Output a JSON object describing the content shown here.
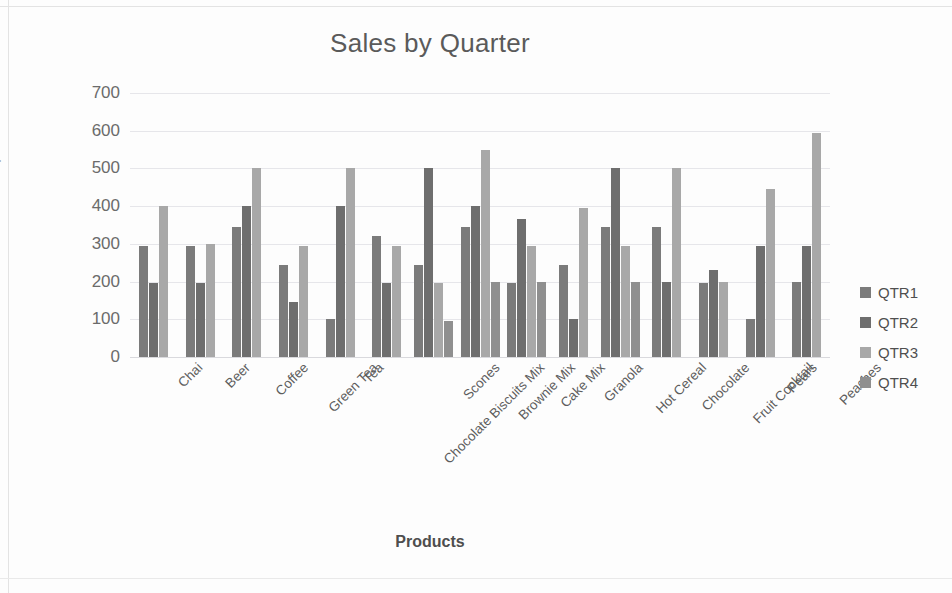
{
  "chart_data": {
    "type": "bar",
    "title": "Sales by Quarter",
    "xlabel": "Products",
    "ylabel": "Sales $",
    "ylim": [
      0,
      700
    ],
    "yticks": [
      700,
      600,
      500,
      400,
      300,
      200,
      100,
      0
    ],
    "grid": true,
    "legend_position": "right",
    "categories": [
      "Chai",
      "Beer",
      "Coffee",
      "Green Tea",
      "Tea",
      "Chocolate Biscuits Mix",
      "Scones",
      "Brownie Mix",
      "Cake Mix",
      "Granola",
      "Hot Cereal",
      "Chocolate",
      "Fruit Cocktail",
      "Pears",
      "Peaches"
    ],
    "series": [
      {
        "name": "QTR1",
        "color": "#7b7b7b",
        "values": [
          295,
          295,
          345,
          245,
          100,
          320,
          245,
          345,
          195,
          245,
          345,
          345,
          195,
          100,
          200
        ]
      },
      {
        "name": "QTR2",
        "color": "#6e6e6e",
        "values": [
          195,
          195,
          400,
          145,
          400,
          195,
          500,
          400,
          365,
          100,
          500,
          200,
          230,
          295,
          295
        ]
      },
      {
        "name": "QTR3",
        "color": "#a8a8a8",
        "values": [
          400,
          300,
          500,
          295,
          500,
          295,
          195,
          550,
          295,
          395,
          295,
          500,
          200,
          445,
          595
        ]
      },
      {
        "name": "QTR4",
        "color": "#8f8f8f",
        "values": [
          null,
          null,
          null,
          null,
          null,
          null,
          95,
          200,
          200,
          null,
          200,
          null,
          null,
          null,
          null
        ]
      }
    ]
  },
  "legend": {
    "items": [
      {
        "label": "QTR1",
        "color": "#7b7b7b"
      },
      {
        "label": "QTR2",
        "color": "#6e6e6e"
      },
      {
        "label": "QTR3",
        "color": "#a8a8a8"
      },
      {
        "label": "QTR4",
        "color": "#8f8f8f"
      }
    ]
  }
}
